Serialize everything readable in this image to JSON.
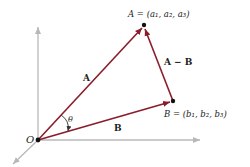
{
  "diagram": {
    "title": "",
    "colors": {
      "vector": "#8b1c2a",
      "axis": "#b8b8b8",
      "point": "#111111",
      "text": "#222222"
    },
    "origin": {
      "label": "O",
      "x": 38,
      "y": 140
    },
    "points": [
      {
        "id": "A",
        "label": "A = (a₁, a₂, a₃)",
        "x": 144,
        "y": 25
      },
      {
        "id": "B",
        "label": "B = (b₁, b₂, b₃)",
        "x": 173,
        "y": 101
      }
    ],
    "vectors": [
      {
        "id": "A",
        "label": "A",
        "from": "O",
        "to": "A"
      },
      {
        "id": "B",
        "label": "B",
        "from": "O",
        "to": "B"
      },
      {
        "id": "A-B",
        "label": "A − B",
        "from": "B",
        "to": "A"
      }
    ],
    "angle": {
      "label": "θ",
      "between": [
        "A",
        "B"
      ]
    },
    "axes": [
      "vertical",
      "horizontal",
      "depth"
    ]
  }
}
